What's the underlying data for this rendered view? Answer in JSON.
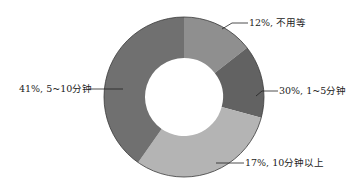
{
  "chart_data": {
    "type": "pie",
    "variant": "donut",
    "title": "",
    "categories": [
      "不用等",
      "1~5分钟",
      "10分钟以上",
      "5~10分钟"
    ],
    "values": [
      12,
      30,
      17,
      41
    ],
    "unit": "%",
    "measured_arc_percent": [
      14,
      15,
      31,
      40
    ],
    "note": "Printed labels do not match drawn wedge sizes: the 17% label points to a ~31% arc and the 30% label points to a ~15% arc. 'values' records the printed labels exactly; 'measured_arc_percent' records the angular extent measured from the pixels. Wedges are rendered from the measured angles.",
    "labels": [
      "12%, 不用等",
      "30%, 1~5分钟",
      "17%, 10分钟以上",
      "41%, 5~10分钟"
    ],
    "colors": [
      "#8f8f8f",
      "#626262",
      "#b4b4b4",
      "#707070"
    ],
    "legend": "none (leader-line labels)",
    "start_angle_deg": 0,
    "direction": "clockwise"
  },
  "geometry": {
    "cx": 184,
    "cy": 97,
    "outer_r": 80,
    "inner_r": 39
  },
  "slices": [
    {
      "label": "12%, 不用等",
      "start": 0,
      "end": 52,
      "color": "#8f8f8f"
    },
    {
      "label": "30%, 1~5分钟",
      "start": 52,
      "end": 105,
      "color": "#626262"
    },
    {
      "label": "17%, 10分钟以上",
      "start": 105,
      "end": 215,
      "color": "#b4b4b4"
    },
    {
      "label": "41%, 5~10分钟",
      "start": 215,
      "end": 360,
      "color": "#707070"
    }
  ]
}
